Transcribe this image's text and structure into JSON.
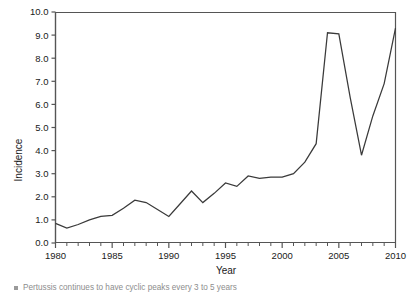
{
  "chart_data": {
    "type": "line",
    "title": "",
    "xlabel": "Year",
    "ylabel": "Incidence",
    "xlim": [
      1980,
      2010
    ],
    "ylim": [
      0.0,
      10.0
    ],
    "grid": false,
    "legend": null,
    "x_major_ticks": [
      1980,
      1985,
      1990,
      1995,
      2000,
      2005,
      2010
    ],
    "x_minor_tick_step": 1,
    "y_ticks": [
      0.0,
      1.0,
      2.0,
      3.0,
      4.0,
      5.0,
      6.0,
      7.0,
      8.0,
      9.0,
      10.0
    ],
    "y_tick_labels": [
      "0.0",
      "1.0",
      "2.0",
      "3.0",
      "4.0",
      "5.0",
      "6.0",
      "7.0",
      "8.0",
      "9.0",
      "10.0"
    ],
    "x_tick_labels": [
      "1980",
      "1985",
      "1990",
      "1995",
      "2000",
      "2005",
      "2010"
    ],
    "line_color": "#3a3a3a",
    "series": [
      {
        "name": "Incidence",
        "x": [
          1980,
          1981,
          1982,
          1983,
          1984,
          1985,
          1986,
          1987,
          1988,
          1989,
          1990,
          1991,
          1992,
          1993,
          1994,
          1995,
          1996,
          1997,
          1998,
          1999,
          2000,
          2001,
          2002,
          2003,
          2004,
          2005,
          2006,
          2007,
          2008,
          2009,
          2010
        ],
        "values": [
          0.85,
          0.65,
          0.8,
          1.0,
          1.15,
          1.2,
          1.5,
          1.85,
          1.75,
          1.45,
          1.15,
          1.7,
          2.25,
          1.75,
          2.15,
          2.6,
          2.45,
          2.9,
          2.8,
          2.85,
          2.85,
          3.0,
          3.5,
          4.3,
          9.1,
          9.05,
          6.3,
          3.8,
          5.5,
          6.9,
          9.3
        ]
      }
    ]
  },
  "axes": {
    "y_axis_title": "Incidence",
    "x_axis_title": "Year"
  },
  "caption": {
    "bullet_text": "Pertussis continues to have cyclic peaks every 3 to 5 years"
  }
}
